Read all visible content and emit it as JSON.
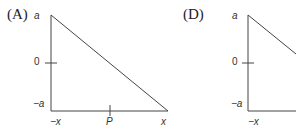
{
  "panels": [
    {
      "label": "(A)",
      "y_ticks": {
        "top": "a",
        "mid": "0",
        "bottom": "−a"
      },
      "x_ticks": {
        "left": "−x",
        "mid": "P",
        "right": "x"
      }
    },
    {
      "label": "(D)",
      "y_ticks": {
        "top": "a",
        "mid": "0",
        "bottom": "−a"
      },
      "x_ticks": {
        "left": "−x"
      }
    }
  ]
}
